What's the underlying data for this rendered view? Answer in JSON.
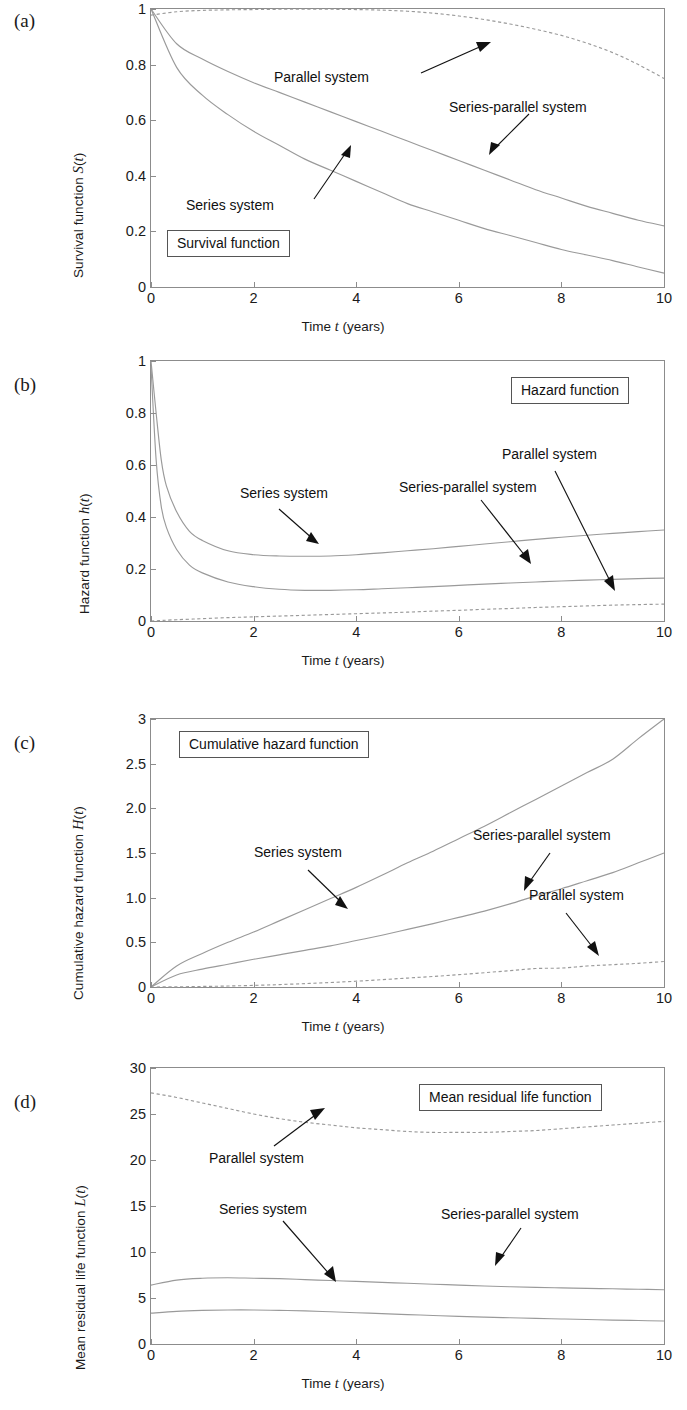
{
  "figure": {
    "panel_labels": [
      "(a)",
      "(b)",
      "(c)",
      "(d)"
    ],
    "shared_xlabel": "Time t (years)",
    "series_names": [
      "Series system",
      "Parallel system",
      "Series-parallel system"
    ],
    "line_color": "#9a9a9a",
    "text_color": "#111111",
    "axis_color": "#8c8c8c"
  },
  "chart_data": [
    {
      "type": "line",
      "panel": "(a)",
      "title": "Survival function",
      "xlabel": "Time t (years)",
      "ylabel": "Survival function S(t)",
      "xlim": [
        0,
        10
      ],
      "ylim": [
        0,
        1
      ],
      "xticks": [
        "0",
        "2",
        "4",
        "6",
        "8",
        "10"
      ],
      "yticks": [
        "0",
        "0.2",
        "0.4",
        "0.6",
        "0.8",
        "1"
      ],
      "grid": false,
      "legend_position": "box-lower-left",
      "x": [
        0,
        0.5,
        1,
        1.5,
        2,
        2.5,
        3,
        3.5,
        4,
        4.5,
        5,
        5.5,
        6,
        6.5,
        7,
        7.5,
        8,
        8.5,
        9,
        9.5,
        10
      ],
      "series": [
        {
          "name": "Series system",
          "style": "solid",
          "values": [
            1.0,
            0.79,
            0.69,
            0.62,
            0.56,
            0.51,
            0.46,
            0.42,
            0.38,
            0.34,
            0.3,
            0.27,
            0.24,
            0.21,
            0.185,
            0.16,
            0.135,
            0.115,
            0.095,
            0.072,
            0.05
          ]
        },
        {
          "name": "Series-parallel system",
          "style": "solid",
          "values": [
            1.0,
            0.875,
            0.82,
            0.775,
            0.735,
            0.7,
            0.665,
            0.63,
            0.595,
            0.56,
            0.525,
            0.49,
            0.455,
            0.42,
            0.385,
            0.35,
            0.32,
            0.29,
            0.265,
            0.24,
            0.22
          ]
        },
        {
          "name": "Parallel system",
          "style": "dashed",
          "values": [
            0.978,
            0.99,
            0.995,
            0.997,
            0.998,
            0.999,
            0.999,
            0.999,
            0.998,
            0.996,
            0.992,
            0.985,
            0.975,
            0.962,
            0.946,
            0.927,
            0.905,
            0.877,
            0.843,
            0.8,
            0.75
          ]
        }
      ],
      "annotations": [
        {
          "text": "Parallel system",
          "points_to": "parallel-curve"
        },
        {
          "text": "Series-parallel system",
          "points_to": "series-parallel-curve"
        },
        {
          "text": "Series system",
          "points_to": "series-curve"
        }
      ]
    },
    {
      "type": "line",
      "panel": "(b)",
      "title": "Hazard function",
      "xlabel": "Time t (years)",
      "ylabel": "Hazard function h(t)",
      "xlim": [
        0,
        10
      ],
      "ylim": [
        0,
        1
      ],
      "xticks": [
        "0",
        "2",
        "4",
        "6",
        "8",
        "10"
      ],
      "yticks": [
        "0",
        "0.2",
        "0.4",
        "0.6",
        "0.8",
        "1"
      ],
      "grid": false,
      "legend_position": "box-upper-right",
      "x": [
        0,
        0.1,
        0.2,
        0.3,
        0.5,
        0.75,
        1,
        1.5,
        2,
        2.5,
        3,
        3.5,
        4,
        4.5,
        5,
        5.5,
        6,
        6.5,
        7,
        7.5,
        8,
        8.5,
        9,
        9.5,
        10
      ],
      "series": [
        {
          "name": "Series system",
          "style": "solid",
          "values": [
            1.0,
            0.8,
            0.62,
            0.52,
            0.42,
            0.345,
            0.31,
            0.27,
            0.255,
            0.25,
            0.249,
            0.25,
            0.255,
            0.262,
            0.27,
            0.278,
            0.287,
            0.296,
            0.305,
            0.314,
            0.322,
            0.33,
            0.337,
            0.344,
            0.35
          ]
        },
        {
          "name": "Series-parallel system",
          "style": "solid",
          "values": [
            0.98,
            0.62,
            0.44,
            0.36,
            0.275,
            0.215,
            0.185,
            0.15,
            0.132,
            0.122,
            0.118,
            0.118,
            0.12,
            0.124,
            0.128,
            0.132,
            0.137,
            0.142,
            0.146,
            0.15,
            0.154,
            0.157,
            0.16,
            0.163,
            0.165
          ]
        },
        {
          "name": "Parallel system",
          "style": "dashed",
          "values": [
            0.0,
            0.001,
            0.002,
            0.003,
            0.005,
            0.007,
            0.009,
            0.013,
            0.016,
            0.019,
            0.022,
            0.025,
            0.028,
            0.031,
            0.034,
            0.038,
            0.041,
            0.045,
            0.048,
            0.052,
            0.055,
            0.058,
            0.061,
            0.063,
            0.065
          ]
        }
      ],
      "annotations": [
        {
          "text": "Parallel system",
          "points_to": "parallel-curve"
        },
        {
          "text": "Series-parallel system",
          "points_to": "series-parallel-curve"
        },
        {
          "text": "Series system",
          "points_to": "series-curve"
        }
      ]
    },
    {
      "type": "line",
      "panel": "(c)",
      "title": "Cumulative hazard function",
      "xlabel": "Time t (years)",
      "ylabel": "Cumulative hazard function H(t)",
      "xlim": [
        0,
        10
      ],
      "ylim": [
        0,
        3
      ],
      "xticks": [
        "0",
        "2",
        "4",
        "6",
        "8",
        "10"
      ],
      "yticks": [
        "0",
        "0.5",
        "1.0",
        "1.5",
        "2.0",
        "2.5",
        "3"
      ],
      "grid": false,
      "legend_position": "box-upper-left",
      "x": [
        0,
        0.5,
        1,
        1.5,
        2,
        2.5,
        3,
        3.5,
        4,
        4.5,
        5,
        5.5,
        6,
        6.5,
        7,
        7.5,
        8,
        8.5,
        9,
        9.5,
        10
      ],
      "series": [
        {
          "name": "Series system",
          "style": "solid",
          "values": [
            0.0,
            0.235,
            0.375,
            0.5,
            0.615,
            0.74,
            0.865,
            0.99,
            1.115,
            1.25,
            1.39,
            1.52,
            1.66,
            1.8,
            1.95,
            2.1,
            2.25,
            2.4,
            2.55,
            2.78,
            3.0
          ]
        },
        {
          "name": "Series-parallel system",
          "style": "solid",
          "values": [
            0.0,
            0.135,
            0.2,
            0.255,
            0.31,
            0.36,
            0.41,
            0.46,
            0.52,
            0.58,
            0.645,
            0.71,
            0.78,
            0.85,
            0.93,
            1.02,
            1.1,
            1.19,
            1.28,
            1.39,
            1.5
          ]
        },
        {
          "name": "Parallel system",
          "style": "dashed",
          "values": [
            0.0,
            0.002,
            0.006,
            0.011,
            0.018,
            0.027,
            0.038,
            0.05,
            0.065,
            0.082,
            0.1,
            0.118,
            0.138,
            0.16,
            0.183,
            0.207,
            0.212,
            0.235,
            0.25,
            0.265,
            0.285
          ]
        }
      ],
      "annotations": [
        {
          "text": "Series system",
          "points_to": "series-curve"
        },
        {
          "text": "Series-parallel system",
          "points_to": "series-parallel-curve"
        },
        {
          "text": "Parallel system",
          "points_to": "parallel-curve"
        }
      ]
    },
    {
      "type": "line",
      "panel": "(d)",
      "title": "Mean residual life function",
      "xlabel": "Time t (years)",
      "ylabel": "Mean residual life function L(t)",
      "xlim": [
        0,
        10
      ],
      "ylim": [
        0,
        30
      ],
      "xticks": [
        "0",
        "2",
        "4",
        "6",
        "8",
        "10"
      ],
      "yticks": [
        "0",
        "5",
        "10",
        "15",
        "20",
        "25",
        "30"
      ],
      "grid": false,
      "legend_position": "box-upper-right",
      "x": [
        0,
        0.5,
        1,
        1.5,
        2,
        2.5,
        3,
        3.5,
        4,
        4.5,
        5,
        5.5,
        6,
        6.5,
        7,
        7.5,
        8,
        8.5,
        9,
        9.5,
        10
      ],
      "series": [
        {
          "name": "Series system",
          "style": "solid",
          "values": [
            3.35,
            3.55,
            3.65,
            3.7,
            3.7,
            3.65,
            3.6,
            3.5,
            3.4,
            3.3,
            3.2,
            3.1,
            3.0,
            2.92,
            2.85,
            2.78,
            2.72,
            2.66,
            2.6,
            2.55,
            2.5
          ]
        },
        {
          "name": "Series-parallel system",
          "style": "solid",
          "values": [
            6.4,
            6.95,
            7.15,
            7.2,
            7.15,
            7.1,
            7.0,
            6.9,
            6.8,
            6.7,
            6.6,
            6.5,
            6.4,
            6.3,
            6.22,
            6.15,
            6.1,
            6.05,
            6.0,
            5.95,
            5.9
          ]
        },
        {
          "name": "Parallel system",
          "style": "dashed",
          "values": [
            27.3,
            26.8,
            26.2,
            25.6,
            25.0,
            24.5,
            24.1,
            23.8,
            23.5,
            23.3,
            23.1,
            23.0,
            23.0,
            23.0,
            23.1,
            23.2,
            23.4,
            23.6,
            23.8,
            24.0,
            24.2
          ]
        }
      ],
      "annotations": [
        {
          "text": "Parallel system",
          "points_to": "parallel-curve"
        },
        {
          "text": "Series system",
          "points_to": "series-curve"
        },
        {
          "text": "Series-parallel system",
          "points_to": "series-parallel-curve"
        }
      ]
    }
  ]
}
